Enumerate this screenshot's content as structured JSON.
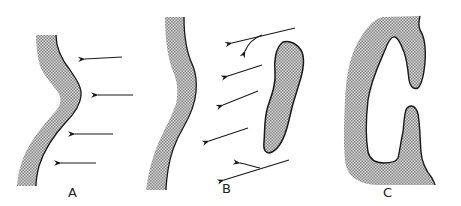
{
  "figure": {
    "panels": [
      {
        "id": "A",
        "label": "A",
        "description": "Single curved stippled wall with four parallel leftward arrows impinging on its convex right face"
      },
      {
        "id": "B",
        "label": "B",
        "description": "Curved stippled wall with a separate elongated stippled body to the right; oblique leftward arrows pass between them, with curved deflected arrows near the top and bottom of the body"
      },
      {
        "id": "C",
        "label": "C",
        "description": "C-shaped stippled mass enclosing a large open cavity, opening to the right between upper and lower lobes"
      }
    ],
    "colors": {
      "fill": "#b8b8b8",
      "stroke": "#1a1a1a",
      "arrow": "#1a1a1a",
      "background": "#ffffff"
    }
  }
}
